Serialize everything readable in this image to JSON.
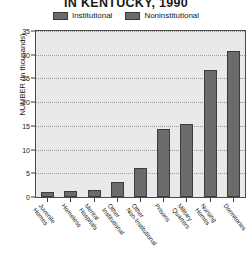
{
  "chart_data": {
    "type": "bar",
    "title": "IN KENTUCKY, 1990",
    "xlabel": "",
    "ylabel": "NUMBER (in thousands)",
    "ylim": [
      0,
      35
    ],
    "yticks": [
      0,
      5,
      10,
      15,
      20,
      25,
      30,
      35
    ],
    "grid": true,
    "legend_position": "top-center",
    "legend": [
      "Institutional",
      "Noninstitutional"
    ],
    "categories": [
      "Juvenile Homes",
      "Homeless",
      "Mental Hospitals",
      "Other Institutional",
      "Other Non-Institutional",
      "Prisons",
      "Military Quarters",
      "Nursing Homes",
      "Dormitories"
    ],
    "values": [
      1.0,
      1.2,
      1.5,
      3.2,
      6.1,
      14.3,
      15.3,
      26.8,
      30.8
    ],
    "bar_color": "#6b6b6b",
    "plot_background": "#e9e9e9"
  },
  "legend": {
    "items": [
      {
        "label": "Institutional",
        "color": "#6b6b6b"
      },
      {
        "label": "Noninstitutional",
        "color": "#6b6b6b"
      }
    ]
  },
  "axes": {
    "y_title": "NUMBER (in thousands)",
    "y_tick_labels": [
      "0",
      "5",
      "10",
      "15",
      "20",
      "25",
      "30",
      "35"
    ],
    "x_tick_labels": [
      "Juvenile Homes",
      "Homeless",
      "Mental Hospitals",
      "Other Institutional",
      "Other Non-Institutional",
      "Prisons",
      "Military Quarters",
      "Nursing Homes",
      "Dormitories"
    ]
  }
}
